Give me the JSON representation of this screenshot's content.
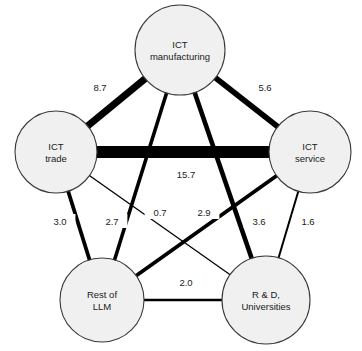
{
  "chart_data": {
    "type": "diagram",
    "subtype": "network-graph",
    "title": "",
    "nodes": [
      {
        "id": "ict_manufacturing",
        "label_line1": "ICT",
        "label_line2": "manufacturing",
        "x": 180,
        "y": 50,
        "r": 45
      },
      {
        "id": "ict_trade",
        "label_line1": "ICT",
        "label_line2": "trade",
        "x": 56,
        "y": 152,
        "r": 41
      },
      {
        "id": "ict_service",
        "label_line1": "ICT",
        "label_line2": "service",
        "x": 310,
        "y": 152,
        "r": 41
      },
      {
        "id": "rest_of_llm",
        "label_line1": "Rest of",
        "label_line2": "LLM",
        "x": 102,
        "y": 300,
        "r": 42
      },
      {
        "id": "rd_universities",
        "label_line1": "R & D,",
        "label_line2": "Universities",
        "x": 266,
        "y": 300,
        "r": 44
      }
    ],
    "edges": [
      {
        "source": "ict_trade",
        "target": "ict_manufacturing",
        "value": "8.7",
        "weight": 8.7,
        "width": 7.0,
        "label_x": 100,
        "label_y": 88
      },
      {
        "source": "ict_manufacturing",
        "target": "ict_service",
        "value": "5.6",
        "weight": 5.6,
        "width": 5.6,
        "label_x": 265,
        "label_y": 88
      },
      {
        "source": "ict_trade",
        "target": "ict_service",
        "value": "15.7",
        "weight": 15.7,
        "width": 12.0,
        "label_x": 186,
        "label_y": 175
      },
      {
        "source": "ict_trade",
        "target": "rest_of_llm",
        "value": "3.0",
        "weight": 3.0,
        "width": 3.8,
        "label_x": 60,
        "label_y": 222
      },
      {
        "source": "ict_manufacturing",
        "target": "rest_of_llm",
        "value": "2.7",
        "weight": 2.7,
        "width": 3.6,
        "label_x": 112,
        "label_y": 222
      },
      {
        "source": "ict_trade",
        "target": "rd_universities",
        "value": "0.7",
        "weight": 0.7,
        "width": 1.3,
        "label_x": 160,
        "label_y": 213
      },
      {
        "source": "ict_service",
        "target": "rest_of_llm",
        "value": "2.9",
        "weight": 2.9,
        "width": 3.8,
        "label_x": 204,
        "label_y": 213
      },
      {
        "source": "ict_manufacturing",
        "target": "rd_universities",
        "value": "3.6",
        "weight": 3.6,
        "width": 4.6,
        "label_x": 259,
        "label_y": 222
      },
      {
        "source": "ict_service",
        "target": "rd_universities",
        "value": "1.6",
        "weight": 1.6,
        "width": 2.0,
        "label_x": 308,
        "label_y": 222
      },
      {
        "source": "rest_of_llm",
        "target": "rd_universities",
        "value": "2.0",
        "weight": 2.0,
        "width": 2.4,
        "label_x": 186,
        "label_y": 283
      }
    ],
    "node_fill_color": "#f0f0f0",
    "node_stroke_color": "#3a3a3a",
    "edge_color": "#000000",
    "label_color": "#1a1a1a",
    "background_color": "#ffffff"
  }
}
